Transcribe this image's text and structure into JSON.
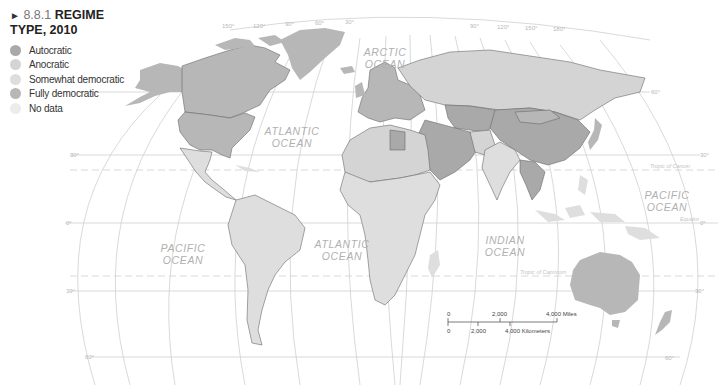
{
  "figure": {
    "number": "8.8.1",
    "title": "REGIME TYPE, 2010",
    "title_line1": "REGIME",
    "title_line2": "TYPE, 2010"
  },
  "legend": {
    "items": [
      {
        "label": "Autocratic",
        "color": "#a9a9a9"
      },
      {
        "label": "Anocratic",
        "color": "#d4d4d4"
      },
      {
        "label": "Somewhat democratic",
        "color": "#dedede"
      },
      {
        "label": "Fully democratic",
        "color": "#b7b7b7"
      },
      {
        "label": "No data",
        "color": "#ececec"
      }
    ]
  },
  "oceans": {
    "arctic": [
      "ARCTIC",
      "OCEAN"
    ],
    "atlantic_north": [
      "ATLANTIC",
      "OCEAN"
    ],
    "atlantic_south": [
      "ATLANTIC",
      "OCEAN"
    ],
    "pacific_east": [
      "PACIFIC",
      "OCEAN"
    ],
    "pacific_west": [
      "PACIFIC",
      "OCEAN"
    ],
    "indian": [
      "INDIAN",
      "OCEAN"
    ]
  },
  "graticule": {
    "top_labels": [
      "150°",
      "120°",
      "90°",
      "60°",
      "30°",
      "0°",
      "30°",
      "60°",
      "90°",
      "120°",
      "150°",
      "180°"
    ],
    "bottom_labels": [
      "150°",
      "120°",
      "90°",
      "60°",
      "30°",
      "0°",
      "30°",
      "60°",
      "90°",
      "120°",
      "150°"
    ],
    "lat_labels_left": [
      "30°",
      "0°",
      "30°",
      "60°"
    ],
    "lat_labels_right": [
      "60°",
      "30°",
      "0°",
      "30°",
      "60°"
    ],
    "tropic_cancer": "Tropic of Cancer",
    "tropic_capricorn": "Tropic of Capricorn",
    "equator": "Equator"
  },
  "scale": {
    "miles_labels": [
      "0",
      "2,000",
      "4,000 Miles"
    ],
    "km_labels": [
      "0",
      "2,000",
      "4,000 Kilometers"
    ]
  }
}
